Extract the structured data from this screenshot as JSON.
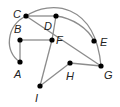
{
  "graph": {
    "nodes": [
      {
        "id": "A",
        "x": 20,
        "y": 62,
        "label": "A",
        "lx": 14,
        "ly": 78
      },
      {
        "id": "B",
        "x": 20,
        "y": 40,
        "label": "B",
        "lx": 14,
        "ly": 33
      },
      {
        "id": "C",
        "x": 26,
        "y": 16,
        "label": "C",
        "lx": 13,
        "ly": 18
      },
      {
        "id": "D",
        "x": 56,
        "y": 16,
        "label": "D",
        "lx": 44,
        "ly": 30
      },
      {
        "id": "E",
        "x": 94,
        "y": 41,
        "label": "E",
        "lx": 100,
        "ly": 46
      },
      {
        "id": "F",
        "x": 52,
        "y": 40,
        "label": "F",
        "lx": 56,
        "ly": 44
      },
      {
        "id": "G",
        "x": 101,
        "y": 66,
        "label": "G",
        "lx": 104,
        "ly": 79
      },
      {
        "id": "H",
        "x": 70,
        "y": 63,
        "label": "H",
        "lx": 66,
        "ly": 80
      },
      {
        "id": "I",
        "x": 40,
        "y": 86,
        "label": "I",
        "lx": 35,
        "ly": 102
      }
    ],
    "edges": [
      {
        "from": "C",
        "to": "D",
        "type": "line"
      },
      {
        "from": "C",
        "to": "G",
        "type": "line",
        "via": "F"
      },
      {
        "from": "C",
        "to": "A",
        "type": "arc"
      },
      {
        "from": "C",
        "to": "G",
        "type": "arc",
        "via": "E"
      },
      {
        "from": "D",
        "to": "E",
        "type": "arc"
      },
      {
        "from": "D",
        "to": "F",
        "type": "line"
      },
      {
        "from": "B",
        "to": "F",
        "type": "line"
      },
      {
        "from": "B",
        "to": "A",
        "type": "line"
      },
      {
        "from": "F",
        "to": "I",
        "type": "line"
      },
      {
        "from": "I",
        "to": "H",
        "type": "line"
      },
      {
        "from": "H",
        "to": "G",
        "type": "line"
      }
    ]
  },
  "colors": {
    "edge": "#8c8c8c",
    "node": "#000000",
    "label": "#222222"
  }
}
